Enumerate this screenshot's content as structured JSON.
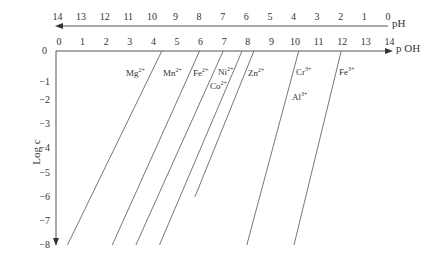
{
  "chart_data": {
    "type": "line",
    "title": "",
    "xlabel": "p OH",
    "x2label": "pH",
    "ylabel": "Log c",
    "xlim": [
      0,
      14
    ],
    "ylim": [
      -8,
      0
    ],
    "grid": false,
    "legend": "inline labels",
    "pOH_ticks": [
      "0",
      "1",
      "2",
      "3",
      "4",
      "5",
      "6",
      "7",
      "8",
      "9",
      "10",
      "11",
      "12",
      "13",
      "14"
    ],
    "pH_ticks": [
      "14",
      "13",
      "12",
      "11",
      "10",
      "9",
      "8",
      "7",
      "6",
      "5",
      "4",
      "3",
      "2",
      "1",
      "0"
    ],
    "y_ticks": [
      "0",
      "-1",
      "-2",
      "-3",
      "-4",
      "-5",
      "-6",
      "-7",
      "-8"
    ],
    "series": [
      {
        "name": "Mg2+",
        "label": "Mg",
        "charge": "2+",
        "x": [
          4.4,
          0.4
        ],
        "y": [
          0,
          -8
        ]
      },
      {
        "name": "Mn2+",
        "label": "Mn",
        "charge": "2+",
        "x": [
          6.0,
          2.3
        ],
        "y": [
          0,
          -8
        ]
      },
      {
        "name": "Fe2+",
        "label": "Fe",
        "charge": "2+",
        "x": [
          7.0,
          3.3
        ],
        "y": [
          0,
          -8
        ]
      },
      {
        "name": "Ni2+",
        "label": "Ni",
        "charge": "2+",
        "x": [
          7.8,
          4.3
        ],
        "y": [
          0,
          -8
        ]
      },
      {
        "name": "Co2+",
        "label": "Co",
        "charge": "2+",
        "x": [
          8.3,
          5.8
        ],
        "y": [
          0,
          -6
        ]
      },
      {
        "name": "Zn2+",
        "label": "Zn",
        "charge": "2+",
        "x": [
          8.3,
          5.8
        ],
        "y": [
          0,
          -6
        ]
      },
      {
        "name": "Cr3+",
        "label": "Cr",
        "charge": "3+",
        "x": [
          10.2,
          8.0
        ],
        "y": [
          0,
          -8
        ]
      },
      {
        "name": "Al3+",
        "label": "Al",
        "charge": "3+",
        "x": [
          10.2,
          8.0
        ],
        "y": [
          0,
          -8
        ]
      },
      {
        "name": "Fe3+",
        "label": "Fe",
        "charge": "3+",
        "x": [
          12.0,
          10.0
        ],
        "y": [
          0,
          -8
        ]
      }
    ]
  },
  "labels": {
    "mg": {
      "base": "Mg",
      "sup": "2+"
    },
    "mn": {
      "base": "Mn",
      "sup": "2+"
    },
    "fe2": {
      "base": "Fe",
      "sup": "2+"
    },
    "ni": {
      "base": "Ni",
      "sup": "2+"
    },
    "co": {
      "base": "Co",
      "sup": "2+"
    },
    "zn": {
      "base": "Zn",
      "sup": "2+"
    },
    "cr": {
      "base": "Cr",
      "sup": "3+"
    },
    "al": {
      "base": "Al",
      "sup": "3+"
    },
    "fe3": {
      "base": "Fe",
      "sup": "3+"
    }
  },
  "axes": {
    "ph_label": "pH",
    "poh_label_p": "p",
    "poh_label_oh": "OH",
    "ylabel": "Log c",
    "y_zero": "0"
  }
}
